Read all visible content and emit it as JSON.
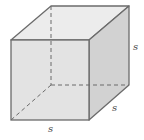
{
  "diagram": {
    "type": "cube",
    "colors": {
      "edge": "#6b6b6b",
      "hidden_edge": "#6b6b6b",
      "front_face": "#e3e3e3",
      "top_face": "#ececec",
      "side_face": "#d2d2d2"
    },
    "labels": {
      "height": "s",
      "depth": "s",
      "width": "s"
    }
  }
}
